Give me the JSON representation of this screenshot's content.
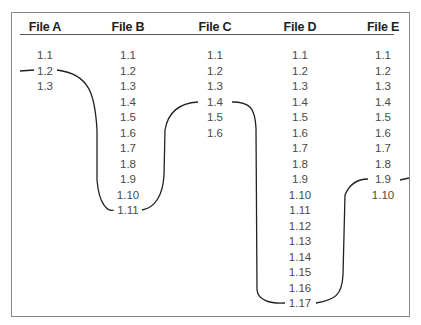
{
  "columns": [
    {
      "name": "File A",
      "x": 45,
      "versions": [
        "1.1",
        "1.2",
        "1.3"
      ]
    },
    {
      "name": "File B",
      "x": 128,
      "versions": [
        "1.1",
        "1.2",
        "1.3",
        "1.4",
        "1.5",
        "1.6",
        "1.7",
        "1.8",
        "1.9",
        "1.10",
        "1.11"
      ]
    },
    {
      "name": "File C",
      "x": 215,
      "versions": [
        "1.1",
        "1.2",
        "1.3",
        "1.4",
        "1.5",
        "1.6"
      ]
    },
    {
      "name": "File D",
      "x": 300,
      "versions": [
        "1.1",
        "1.2",
        "1.3",
        "1.4",
        "1.5",
        "1.6",
        "1.7",
        "1.8",
        "1.9",
        "1.10",
        "1.11",
        "1.12",
        "1.13",
        "1.14",
        "1.15",
        "1.16",
        "1.17"
      ]
    },
    {
      "name": "File E",
      "x": 383,
      "versions": [
        "1.1",
        "1.2",
        "1.3",
        "1.4",
        "1.5",
        "1.6",
        "1.7",
        "1.8",
        "1.9",
        "1.10"
      ]
    }
  ],
  "tag_line": {
    "label": "",
    "points": [
      {
        "file": "File A",
        "version": "1.2"
      },
      {
        "file": "File B",
        "version": "1.10"
      },
      {
        "file": "File C",
        "version": "1.4"
      },
      {
        "file": "File D",
        "version": "1.17"
      },
      {
        "file": "File E",
        "version": "1.8"
      }
    ],
    "color": "#222222"
  }
}
